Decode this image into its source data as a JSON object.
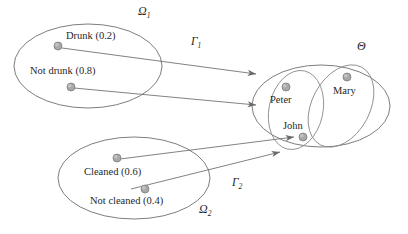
{
  "figure": {
    "kind": "set-mapping-diagram",
    "background_color": "#ffffff",
    "stroke_color": "#6e6e6e",
    "dot_color": "#a8a8a8",
    "text_color": "#1f1f1f"
  },
  "sets": {
    "source_one": {
      "label": "Ω",
      "subscript": "1",
      "elements": [
        {
          "label": "Drunk (0.2)",
          "name": "Drunk",
          "mass": "0.2"
        },
        {
          "label": "Not drunk (0.8)",
          "name": "Not drunk",
          "mass": "0.8"
        }
      ]
    },
    "source_two": {
      "label": "Ω",
      "subscript": "2",
      "elements": [
        {
          "label": "Cleaned (0.6)",
          "name": "Cleaned",
          "mass": "0.6"
        },
        {
          "label": "Not cleaned (0.4)",
          "name": "Not cleaned",
          "mass": "0.4"
        }
      ]
    },
    "frame": {
      "label": "Θ",
      "members": [
        {
          "label": "Peter"
        },
        {
          "label": "John"
        },
        {
          "label": "Mary"
        }
      ]
    }
  },
  "mappings": [
    {
      "label": "Γ",
      "subscript": "1",
      "from": "source_one",
      "to": "frame"
    },
    {
      "label": "Γ",
      "subscript": "2",
      "from": "source_two",
      "to": "frame"
    }
  ]
}
